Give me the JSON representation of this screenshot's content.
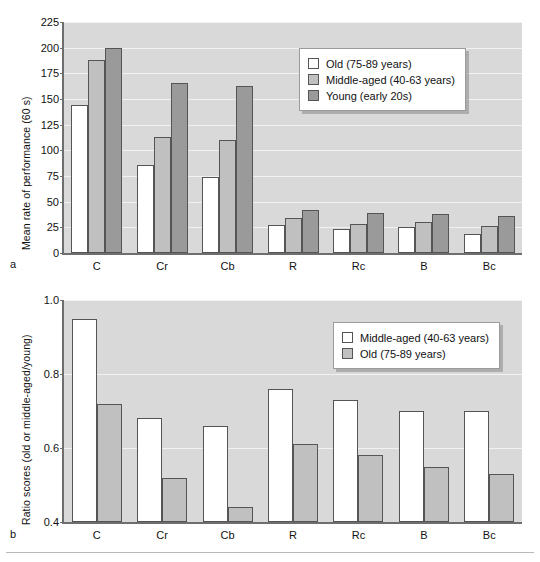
{
  "figure": {
    "panels": [
      {
        "letter": "a",
        "legend": {
          "entries": [
            {
              "label": "Old (75-89 years)",
              "style": "series-white"
            },
            {
              "label": "Middle-aged (40-63 years)",
              "style": "series-light"
            },
            {
              "label": "Young (early 20s)",
              "style": "series-dark"
            }
          ]
        }
      },
      {
        "letter": "b",
        "legend": {
          "entries": [
            {
              "label": "Middle-aged (40-63 years)",
              "style": "series-white"
            },
            {
              "label": "Old (75-89 years)",
              "style": "series-light"
            }
          ]
        }
      }
    ]
  },
  "chart_data": [
    {
      "type": "bar",
      "panel": "a",
      "title": "",
      "xlabel": "",
      "ylabel": "Mean rate of performance (60 s)",
      "ylim": [
        0,
        225
      ],
      "yticks": [
        0,
        25,
        50,
        75,
        100,
        125,
        150,
        175,
        200,
        225
      ],
      "grid": true,
      "legend_position": "upper-right",
      "categories": [
        "C",
        "Cr",
        "Cb",
        "R",
        "Rc",
        "B",
        "Bc"
      ],
      "series": [
        {
          "name": "Old (75-89 years)",
          "style": "series-white",
          "values": [
            144,
            86,
            74,
            27,
            23,
            25,
            19
          ]
        },
        {
          "name": "Middle-aged (40-63 years)",
          "style": "series-light",
          "values": [
            188,
            113,
            110,
            34,
            28,
            30,
            26
          ]
        },
        {
          "name": "Young (early 20s)",
          "style": "series-dark",
          "values": [
            200,
            166,
            163,
            42,
            39,
            38,
            36
          ]
        }
      ]
    },
    {
      "type": "bar",
      "panel": "b",
      "title": "",
      "xlabel": "",
      "ylabel": "Ratio scores (old or middle-aged/young)",
      "ylim": [
        0.4,
        1.0
      ],
      "yticks": [
        0.4,
        0.6,
        0.8,
        1.0
      ],
      "ytick_labels": [
        "0.4",
        "0.6",
        "0.8",
        "1.0"
      ],
      "grid": true,
      "legend_position": "upper-right",
      "categories": [
        "C",
        "Cr",
        "Cb",
        "R",
        "Rc",
        "B",
        "Bc"
      ],
      "series": [
        {
          "name": "Middle-aged (40-63 years)",
          "style": "series-white",
          "values": [
            0.95,
            0.68,
            0.66,
            0.76,
            0.73,
            0.7,
            0.7
          ]
        },
        {
          "name": "Old (75-89 years)",
          "style": "series-light",
          "values": [
            0.72,
            0.52,
            0.44,
            0.61,
            0.58,
            0.55,
            0.53
          ]
        }
      ]
    }
  ]
}
